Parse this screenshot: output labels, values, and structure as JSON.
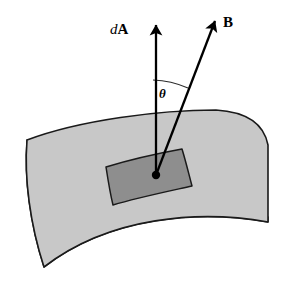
{
  "figure": {
    "background_color": "#ffffff",
    "width": 289,
    "height": 285
  },
  "labels": {
    "area_vector": {
      "differential": "d",
      "vector": "A",
      "full_text": "dA"
    },
    "field_vector": "B",
    "angle": "θ"
  },
  "colors": {
    "surface_fill": "#c8c8c8",
    "surface_stroke": "#1a1a1a",
    "patch_fill": "#8e8e8e",
    "patch_stroke": "#1a1a1a",
    "edge_band_fill": "#bdbdbd",
    "vector_stroke": "#000000",
    "arc_stroke": "#2b2b2b",
    "origin_dot": "#000000"
  },
  "geometry": {
    "surface_top_edge": "M27,140 C80,120 160,110 216,110 L216,110",
    "surface_right_edge": "M216,110 C248,112 264,124 268,145 L268,222",
    "surface_bottom_edge": "M268,222 C200,210 110,216 44,267",
    "surface_left_edge": "M44,267 C30,224 24,178 27,140",
    "patch_outline": "M106,167 C132,159 160,153 182,149 C186,162 189,175 192,186 C165,192 136,198 113,205 C110,193 108,180 106,167 Z",
    "origin_point": [
      156,
      175
    ],
    "da_vector": {
      "from": [
        156,
        175
      ],
      "to": [
        156,
        18
      ],
      "head_width": 9,
      "head_length": 17
    },
    "b_vector": {
      "from": [
        156,
        175
      ],
      "to": [
        218,
        14
      ],
      "head_width": 9,
      "head_length": 18
    },
    "angle_arc": {
      "from": [
        153,
        80
      ],
      "to": [
        188,
        88
      ],
      "radius": 96
    }
  },
  "annotations": {
    "da_label_position": [
      110,
      22
    ],
    "b_label_position": [
      223,
      15
    ],
    "theta_label_position": [
      159,
      87
    ]
  }
}
